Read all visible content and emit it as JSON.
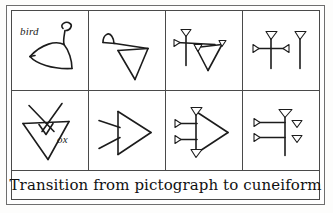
{
  "figure": {
    "caption": "Transition from pictograph to cuneiform",
    "frame_color": "#4a4a4a",
    "ink_color": "#1c1c1c",
    "paper_color": "#ffffff",
    "columns": 4,
    "rows": 2
  },
  "rows": [
    {
      "id": "row-bird",
      "subject": "bird",
      "label": "bird",
      "cells": [
        {
          "name": "bird-pictograph",
          "stage": "pictograph",
          "icon": "bird-pictograph-icon",
          "description": "outline drawing of a bird facing right with raised head"
        },
        {
          "name": "bird-rotated",
          "stage": "rotated-pictograph",
          "icon": "bird-rotated-icon",
          "description": "bird sign turned ninety degrees, head at upper left, body a downward triangle"
        },
        {
          "name": "bird-early-cuneiform",
          "stage": "early-cuneiform",
          "icon": "bird-early-cuneiform-icon",
          "description": "wedge-headed strokes, vertical stroke crossed by horizontal, triangular body"
        },
        {
          "name": "bird-late-cuneiform",
          "stage": "late-cuneiform",
          "icon": "bird-late-cuneiform-icon",
          "description": "two vertical wedges, left one crossed by a horizontal wedge stroke"
        }
      ]
    },
    {
      "id": "row-ox",
      "subject": "ox",
      "label": "ox",
      "cells": [
        {
          "name": "ox-pictograph",
          "stage": "pictograph",
          "icon": "ox-pictograph-icon",
          "description": "ox head seen from front with two curving horns"
        },
        {
          "name": "ox-rotated",
          "stage": "rotated-pictograph",
          "icon": "ox-rotated-icon",
          "description": "ox head turned on its side, triangle pointing right with two horn lines"
        },
        {
          "name": "ox-early-cuneiform",
          "stage": "early-cuneiform",
          "icon": "ox-early-cuneiform-icon",
          "description": "triangular head formed of wedge strokes with two horizontal wedges at left"
        },
        {
          "name": "ox-late-cuneiform",
          "stage": "late-cuneiform",
          "icon": "ox-late-cuneiform-icon",
          "description": "vertical wedge with two horizontal wedges left and two small wedges right"
        }
      ]
    }
  ]
}
